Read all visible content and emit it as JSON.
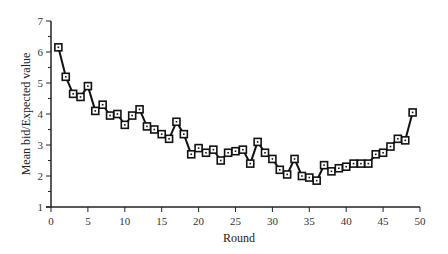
{
  "chart_data": {
    "type": "line",
    "title": "",
    "xlabel": "Round",
    "ylabel": "Mean bid/Expected value",
    "xlim": [
      0,
      50
    ],
    "ylim": [
      1,
      7
    ],
    "xticks": [
      0,
      5,
      10,
      15,
      20,
      25,
      30,
      35,
      40,
      45,
      50
    ],
    "yticks": [
      1,
      2,
      3,
      4,
      5,
      6,
      7
    ],
    "grid": false,
    "legend": null,
    "marker": "square",
    "series": [
      {
        "name": "Mean bid/Expected value",
        "x": [
          1,
          2,
          3,
          4,
          5,
          6,
          7,
          8,
          9,
          10,
          11,
          12,
          13,
          14,
          15,
          16,
          17,
          18,
          19,
          20,
          21,
          22,
          23,
          24,
          25,
          26,
          27,
          28,
          29,
          30,
          31,
          32,
          33,
          34,
          35,
          36,
          37,
          38,
          39,
          40,
          41,
          42,
          43,
          44,
          45,
          46,
          47,
          48,
          49
        ],
        "values": [
          6.15,
          5.2,
          4.65,
          4.55,
          4.9,
          4.1,
          4.3,
          3.95,
          4.0,
          3.65,
          3.95,
          4.15,
          3.6,
          3.5,
          3.35,
          3.2,
          3.75,
          3.35,
          2.7,
          2.9,
          2.75,
          2.85,
          2.5,
          2.75,
          2.8,
          2.85,
          2.4,
          3.1,
          2.75,
          2.55,
          2.2,
          2.05,
          2.55,
          2.0,
          1.95,
          1.85,
          2.35,
          2.15,
          2.25,
          2.3,
          2.4,
          2.4,
          2.4,
          2.7,
          2.75,
          2.95,
          3.2,
          3.15,
          4.05
        ]
      }
    ]
  },
  "colors": {
    "line": "#111111",
    "axis": "#222222",
    "text": "#333333",
    "background": "#ffffff"
  }
}
